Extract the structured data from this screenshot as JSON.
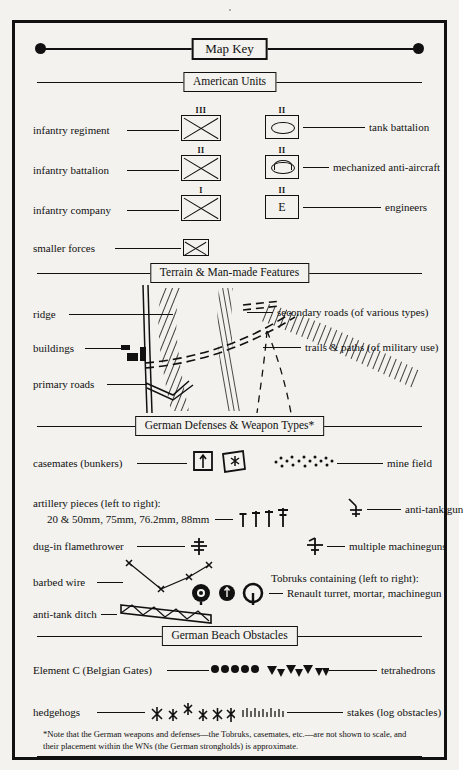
{
  "document": {
    "title": "Map Key",
    "background_color": "#f3f2ee",
    "ink_color": "#111111"
  },
  "sections": [
    {
      "id": "map-key",
      "label": "Map Key"
    },
    {
      "id": "american-units",
      "label": "American Units"
    },
    {
      "id": "terrain",
      "label": "Terrain & Man-made Features"
    },
    {
      "id": "german-defenses",
      "label": "German Defenses & Weapon Types*"
    },
    {
      "id": "beach-obstacles",
      "label": "German  Beach  Obstacles"
    }
  ],
  "american_units": {
    "left": [
      {
        "label": "infantry regiment",
        "echelon": "III",
        "symbol": "infantry-cross-box"
      },
      {
        "label": "infantry battalion",
        "echelon": "II",
        "symbol": "infantry-cross-box"
      },
      {
        "label": "infantry company",
        "echelon": "I",
        "symbol": "infantry-cross-box"
      },
      {
        "label": "smaller forces",
        "echelon": "",
        "symbol": "infantry-cross-box-small"
      }
    ],
    "right": [
      {
        "label": "tank battalion",
        "echelon": "II",
        "symbol": "tank-oval-box"
      },
      {
        "label": "mechanized anti-aircraft",
        "echelon": "II",
        "symbol": "mech-aa-box"
      },
      {
        "label": "engineers",
        "echelon": "II",
        "symbol": "engineer-e-box"
      }
    ]
  },
  "terrain": {
    "left_labels": [
      {
        "label": "ridge"
      },
      {
        "label": "buildings"
      },
      {
        "label": "primary roads"
      }
    ],
    "right_labels": [
      {
        "label": "secondary roads (of various types)"
      },
      {
        "label": "trails & paths (of military use)"
      }
    ]
  },
  "german_defenses": {
    "casemates": {
      "label": "casemates (bunkers)"
    },
    "mine_field": {
      "label": "mine field"
    },
    "artillery": {
      "label_line1": "artillery pieces (left to right):",
      "label_line2": "20 & 50mm, 75mm, 76.2mm, 88mm"
    },
    "anti_tank_gun": {
      "label": "anti-tank gun"
    },
    "flamethrower": {
      "label": "dug-in flamethrower"
    },
    "machineguns": {
      "label": "multiple machineguns"
    },
    "barbed_wire": {
      "label": "barbed wire"
    },
    "tobruks": {
      "label_line1": "Tobruks containing (left to right):",
      "label_line2": "Renault turret, mortar, machinegun"
    },
    "anti_tank_ditch": {
      "label": "anti-tank ditch"
    }
  },
  "beach_obstacles": {
    "element_c": {
      "label": "Element C (Belgian Gates)",
      "count": 5
    },
    "tetrahedrons": {
      "label": "tetrahedrons",
      "count": 7
    },
    "hedgehogs": {
      "label": "hedgehogs",
      "count": 6
    },
    "stakes": {
      "label": "stakes (log obstacles)"
    }
  },
  "footnote": {
    "text": "*Note that the German weapons and defenses—the Tobruks, casemates, etc.—are not shown to scale, and their placement within the WNs (the German strongholds) is approximate."
  }
}
